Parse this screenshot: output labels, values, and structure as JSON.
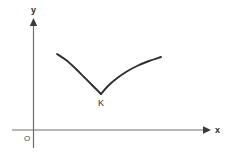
{
  "figure": {
    "background_color": "#ffffff",
    "axis_color": "#6e6e6e",
    "curve_color": "#2e2e2e",
    "label_color": "#2b2b2b",
    "width": 228,
    "height": 152
  },
  "axes": {
    "y_axis_label": "y",
    "x_axis_label": "x",
    "origin_label": "O",
    "y_axis": {
      "x": 33,
      "top": 18,
      "bottom": 148
    },
    "x_axis": {
      "y": 130,
      "left": 12,
      "right": 210
    }
  },
  "chart_data": {
    "type": "line",
    "title": "",
    "xlabel": "x",
    "ylabel": "y",
    "grid": false,
    "legend": "none",
    "annotations": [
      {
        "label": "K",
        "role": "cusp-point",
        "x": 101,
        "y": 94
      },
      {
        "label": "O",
        "role": "origin",
        "x": 33,
        "y": 130
      }
    ],
    "series": [
      {
        "name": "left-branch",
        "description": "descending concave curve falling from upper left to the cusp at K",
        "points": [
          [
            57,
            54
          ],
          [
            66,
            60
          ],
          [
            75,
            68
          ],
          [
            84,
            77
          ],
          [
            92,
            85
          ],
          [
            97,
            90
          ],
          [
            101,
            94
          ]
        ]
      },
      {
        "name": "right-branch",
        "description": "ascending concave-down curve rising from the cusp at K to the upper right",
        "points": [
          [
            101,
            94
          ],
          [
            108,
            86
          ],
          [
            116,
            79
          ],
          [
            126,
            72
          ],
          [
            137,
            66
          ],
          [
            149,
            61
          ],
          [
            161,
            57
          ]
        ]
      }
    ]
  }
}
